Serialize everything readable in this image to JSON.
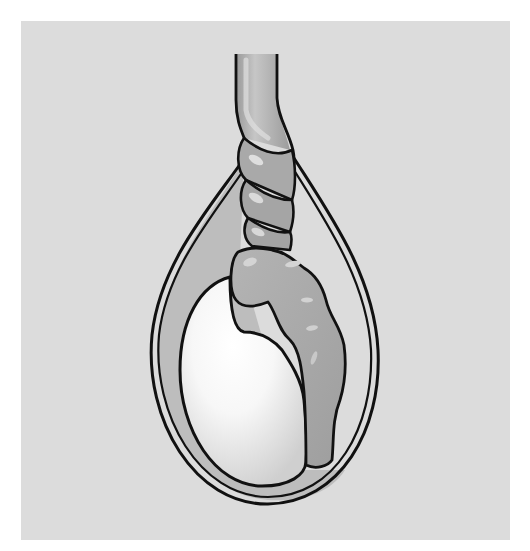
{
  "figure": {
    "parts": [
      {
        "id": "spermatic-cord",
        "label": "spermatic cord (twisted)"
      },
      {
        "id": "scrotal-sac",
        "label": "tunica vaginalis / sac"
      },
      {
        "id": "testis",
        "label": "testis"
      },
      {
        "id": "epididymis",
        "label": "epididymis"
      }
    ]
  },
  "colors": {
    "page_background": "#ffffff",
    "panel_background": "#dcdcdc",
    "sac_inner_shade": "#bdbdbd",
    "cord_fill": "#a8a8a8",
    "cord_highlight": "#cfcfcf",
    "cord_shadow": "#8e8e8e",
    "epididymis_fill": "#a9a9a9",
    "epididymis_highlight": "#d0d0d0",
    "testis_center": "#ffffff",
    "testis_edge": "#d6d6d6",
    "outline": "#111111"
  }
}
